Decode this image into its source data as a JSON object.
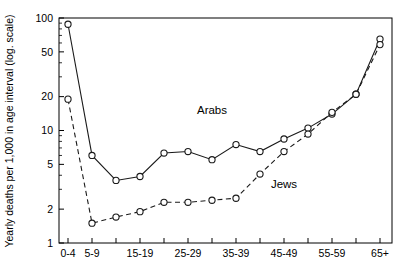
{
  "chart_data": {
    "type": "line",
    "title": "",
    "subtitle": "",
    "xlabel": "",
    "ylabel": "Yearly deaths per 1,000 in age interval (log. scale)",
    "yscale": "log",
    "ylim": [
      1,
      100
    ],
    "ytick_labels": [
      "1",
      "2",
      "5",
      "10",
      "20",
      "50",
      "100"
    ],
    "ytick_values": [
      1,
      2,
      5,
      10,
      20,
      50,
      100
    ],
    "grid": false,
    "legend_position": "inline-annotation",
    "categories": [
      "0-4",
      "5-9",
      "10-14",
      "15-19",
      "20-24",
      "25-29",
      "30-34",
      "35-39",
      "40-44",
      "45-49",
      "50-54",
      "55-59",
      "60-64",
      "65+"
    ],
    "xtick_labels_shown": [
      "0-4",
      "5-9",
      "",
      "15-19",
      "",
      "25-29",
      "",
      "35-39",
      "",
      "45-49",
      "",
      "55-59",
      "",
      "65+"
    ],
    "series": [
      {
        "name": "Arabs",
        "style": "solid",
        "marker": "open-circle",
        "values": [
          88,
          6.0,
          3.6,
          3.9,
          6.3,
          6.5,
          5.5,
          7.5,
          6.5,
          8.4,
          10.5,
          14.0,
          21.0,
          65.0
        ]
      },
      {
        "name": "Jews",
        "style": "dashed",
        "marker": "open-circle",
        "values": [
          19,
          1.5,
          1.7,
          1.9,
          2.3,
          2.3,
          2.4,
          2.5,
          4.1,
          6.5,
          9.3,
          14.5,
          21.0,
          58.0
        ]
      }
    ],
    "annotations": [
      {
        "text": "Arabs",
        "x_category": "30-34",
        "y_value": 14.0
      },
      {
        "text": "Jews",
        "x_category": "45-49",
        "y_value": 3.1
      }
    ]
  },
  "colors": {
    "axis": "#000000",
    "series_line": "#1a1a1a",
    "marker_fill": "#ffffff",
    "background": "#ffffff"
  }
}
